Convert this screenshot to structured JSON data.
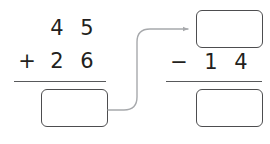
{
  "worksheet": {
    "type": "two-step-arithmetic-chain",
    "background_color": "#ffffff",
    "ink_color": "#231f20",
    "box_border_color": "#4d4d4f",
    "rule_color": "#58595b",
    "arrow_color": "#a7a9ac"
  },
  "problems": [
    {
      "id": "left-addition",
      "operator": "+",
      "top_operand": {
        "tens": "4",
        "ones": "5"
      },
      "bottom_operand": {
        "tens": "2",
        "ones": "6"
      },
      "answer": ""
    },
    {
      "id": "right-subtraction",
      "operator": "−",
      "top_operand": {
        "tens": "",
        "ones": ""
      },
      "bottom_operand": {
        "tens": "1",
        "ones": "4"
      },
      "answer": ""
    }
  ],
  "connector": {
    "name": "arrow-from-sum-to-minuend",
    "from": "left-addition-answer-box",
    "to": "right-subtraction-top-box"
  }
}
